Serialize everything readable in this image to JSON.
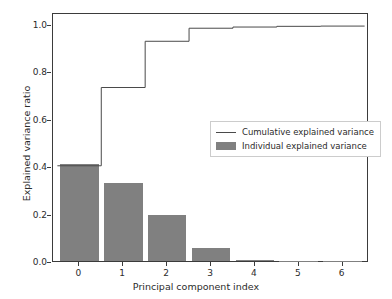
{
  "chart_data": {
    "type": "bar",
    "title": "",
    "xlabel": "Principal component index",
    "ylabel": "Explained variance ratio",
    "categories": [
      "0",
      "1",
      "2",
      "3",
      "4",
      "5",
      "6"
    ],
    "x": [
      0,
      1,
      2,
      3,
      4,
      5,
      6
    ],
    "xlim": [
      -0.6,
      6.6
    ],
    "ylim": [
      0.0,
      1.05
    ],
    "grid": false,
    "legend_position": "center-right",
    "yticks": [
      "0.0",
      "0.2",
      "0.4",
      "0.6",
      "0.8",
      "1.0"
    ],
    "ytick_values": [
      0.0,
      0.2,
      0.4,
      0.6,
      0.8,
      1.0
    ],
    "series": [
      {
        "name": "Individual explained variance",
        "type": "bar",
        "color": "#808080",
        "values": [
          0.41,
          0.33,
          0.195,
          0.055,
          0.005,
          0.001,
          0.0005
        ]
      },
      {
        "name": "Cumulative explained variance",
        "type": "step",
        "color": "#4a4a4a",
        "values": [
          0.41,
          0.74,
          0.935,
          0.99,
          0.995,
          0.998,
          0.999
        ]
      }
    ]
  },
  "legend": {
    "entries": [
      {
        "label": "Cumulative explained variance",
        "marker": "line"
      },
      {
        "label": "Individual explained variance",
        "marker": "patch"
      }
    ]
  },
  "colors": {
    "bar_fill": "#808080",
    "line": "#4a4a4a",
    "axis": "#3b3b3b",
    "text": "#2b2b2b",
    "background": "#ffffff",
    "legend_border": "#cccccc"
  }
}
